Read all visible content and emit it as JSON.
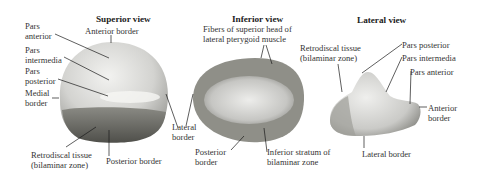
{
  "figure": {
    "panels": [
      {
        "title": "Superior view",
        "labels": [
          "Pars\nanterior",
          "Anterior border",
          "Pars\nintermedia",
          "Pars\nposterior",
          "Medial\nborder",
          "Lateral\nborder",
          "Retrodiscal tissue\n(bilaminar zone)",
          "Posterior border"
        ]
      },
      {
        "title": "Inferior view",
        "labels": [
          "Fibers of superior head of\nlateral pterygoid muscle",
          "Posterior\nborder",
          "Inferior stratum of\nbilaminar zone"
        ]
      },
      {
        "title": "Lateral view",
        "labels": [
          "Retrodiscal tissue\n(bilaminar zone)",
          "Pars posterior",
          "Pars intermedia",
          "Pars anterior",
          "Anterior\nborder",
          "Lateral border"
        ]
      }
    ]
  },
  "colors": {
    "disc_light": "#e6e6e4",
    "disc_mid": "#bdbdba",
    "disc_dark": "#6f6f6a",
    "leader_line": "#1a1a1a"
  }
}
